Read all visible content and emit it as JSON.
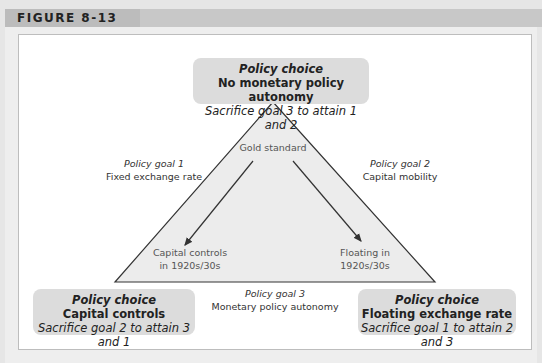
{
  "figure": {
    "label": "FIGURE 8-13"
  },
  "policy_choices": {
    "top": {
      "head": "Policy choice",
      "title": "No monetary policy autonomy",
      "sub": "Sacrifice goal 3 to attain 1 and 2"
    },
    "bottom_left": {
      "head": "Policy choice",
      "title": "Capital controls",
      "sub": "Sacrifice goal 2 to attain 3 and 1"
    },
    "bottom_right": {
      "head": "Policy choice",
      "title": "Floating exchange rate",
      "sub": "Sacrifice goal 1 to attain 2 and 3"
    }
  },
  "policy_goals": {
    "goal1": {
      "title": "Policy goal 1",
      "name": "Fixed exchange rate"
    },
    "goal2": {
      "title": "Policy goal 2",
      "name": "Capital mobility"
    },
    "goal3": {
      "title": "Policy goal 3",
      "name": "Monetary policy autonomy"
    }
  },
  "triangle_labels": {
    "apex": "Gold standard",
    "left_line1": "Capital controls",
    "left_line2": "in 1920s/30s",
    "right_line1": "Floating in",
    "right_line2": "1920s/30s"
  },
  "colors": {
    "triangle_fill": "#ececec",
    "box_fill": "#dcdcdc",
    "header_bar": "#c8c8c8",
    "line": "#333333"
  }
}
